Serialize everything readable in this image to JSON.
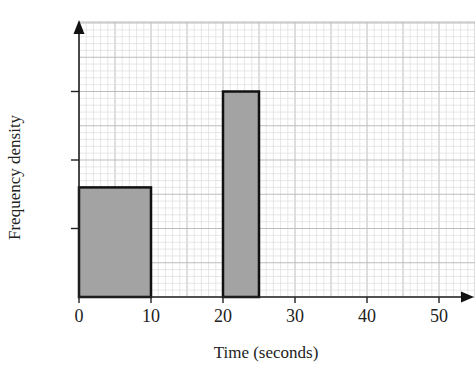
{
  "chart_data": {
    "type": "bar",
    "subtype": "histogram",
    "title": "",
    "xlabel": "Time (seconds)",
    "ylabel": "Frequency density",
    "x_ticks": [
      "0",
      "10",
      "20",
      "30",
      "40",
      "50"
    ],
    "y_ticks": [
      "",
      "",
      ""
    ],
    "y_ticks_note": "three unlabeled tick marks at 1, 2, 3 units",
    "xlim": [
      0,
      55
    ],
    "ylim": [
      0,
      4
    ],
    "grid": true,
    "bars": [
      {
        "x_start": 0,
        "x_end": 10,
        "height": 1.6
      },
      {
        "x_start": 20,
        "x_end": 25,
        "height": 3
      }
    ],
    "colors": {
      "bar_fill": "#a3a3a3",
      "bar_edge": "#111111",
      "grid_minor": "#dcdcdc",
      "grid_major": "#bdbdbd"
    }
  },
  "labels": {
    "xlabel": "Time (seconds)",
    "ylabel": "Frequency density",
    "xticks": [
      "0",
      "10",
      "20",
      "30",
      "40",
      "50"
    ]
  }
}
